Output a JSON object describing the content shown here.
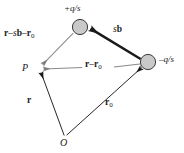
{
  "figure": {
    "type": "vector-diagram",
    "colors": {
      "line_black": "#1a1a1a",
      "line_gray": "#8a8a8a",
      "node_fill": "#c9c9c9",
      "node_stroke": "#3a3a3a",
      "background": "#ffffff"
    },
    "nodes": [
      {
        "id": "charge-positive",
        "label": "+q/s",
        "label_sign": "+",
        "label_body": "q/s",
        "x": 80,
        "y": 27,
        "radius": 8
      },
      {
        "id": "charge-negative",
        "label": "–q/s",
        "label_sign": "–",
        "label_body": "q/s",
        "x": 148,
        "y": 62,
        "radius": 8
      }
    ],
    "points": [
      {
        "id": "field-point",
        "label": "P",
        "x": 38,
        "y": 68
      },
      {
        "id": "origin",
        "label": "O",
        "x": 65,
        "y": 137
      }
    ],
    "vectors": [
      {
        "id": "r-minus-sb-minus-r0",
        "label_plain": "r – sb – r₀",
        "from": "charge-positive",
        "to": "field-point",
        "style": "thin-gray"
      },
      {
        "id": "sb",
        "label_plain": "sb",
        "from": "charge-negative",
        "to": "charge-positive",
        "style": "thick-black"
      },
      {
        "id": "r-minus-r0",
        "label_plain": "r – r₀",
        "from": "charge-negative",
        "to": "field-point",
        "style": "thin-gray"
      },
      {
        "id": "r",
        "label_plain": "r",
        "from": "origin",
        "to": "field-point",
        "style": "thin-black"
      },
      {
        "id": "r0",
        "label_plain": "r₀",
        "from": "origin",
        "to": "charge-negative",
        "style": "thin-black"
      }
    ],
    "labels": {
      "charge_positive": {
        "sign": "+",
        "body": "q/s"
      },
      "charge_negative": {
        "sign": "–",
        "body": "q/s"
      },
      "vec_r_minus_sb_minus_r0": {
        "r": "r",
        "minus1": "–",
        "s": "s",
        "b": "b",
        "minus2": "–",
        "r0": "r",
        "r0sub": "0"
      },
      "vec_sb": {
        "s": "s",
        "b": "b"
      },
      "vec_r_minus_r0": {
        "r": "r",
        "minus": "–",
        "r0": "r",
        "r0sub": "0"
      },
      "vec_r": {
        "r": "r"
      },
      "vec_r0": {
        "r": "r",
        "sub": "0"
      },
      "point_p": "P",
      "point_o": "O"
    }
  }
}
